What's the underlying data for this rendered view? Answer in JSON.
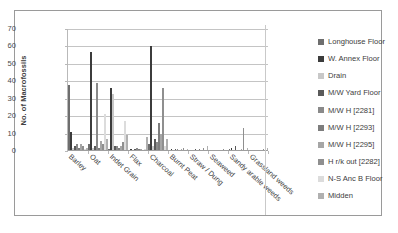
{
  "chart_data": {
    "type": "bar",
    "title": "",
    "xlabel": "",
    "ylabel": "No. of Macrofossils",
    "ylim": [
      0,
      70
    ],
    "yticks": [
      0,
      10,
      20,
      30,
      40,
      50,
      60,
      70
    ],
    "grid": true,
    "legend_position": "right",
    "categories": [
      "Barley",
      "Oat",
      "Indet Grain",
      "Flax",
      "Charcoal",
      "Burnt Peat",
      "Straw / Dung",
      "Seaweed",
      "Sandy arable weeds",
      "Grassland weeds"
    ],
    "series": [
      {
        "name": "Longhouse Floor",
        "color": "#6e6e6e",
        "values": [
          38,
          4,
          1,
          0,
          4,
          0,
          0,
          0,
          1,
          0
        ]
      },
      {
        "name": "W. Annex Floor",
        "color": "#3c3c3c",
        "values": [
          11,
          57,
          36,
          1,
          60,
          1,
          0,
          0,
          2,
          0
        ]
      },
      {
        "name": "Drain",
        "color": "#c8c8c8",
        "values": [
          2,
          2,
          33,
          0,
          3,
          0,
          0,
          0,
          0,
          0
        ]
      },
      {
        "name": "M/W Yard Floor",
        "color": "#5a5a5a",
        "values": [
          3,
          3,
          3,
          1,
          7,
          1,
          1,
          0,
          3,
          0
        ]
      },
      {
        "name": "M/W H [2281]",
        "color": "#8a8a8a",
        "values": [
          4,
          39,
          3,
          2,
          5,
          1,
          0,
          0,
          0,
          0
        ]
      },
      {
        "name": "M/W H [2293]",
        "color": "#7d7d7d",
        "values": [
          2,
          2,
          2,
          1,
          16,
          0,
          1,
          0,
          0,
          0
        ]
      },
      {
        "name": "M/W H [2295]",
        "color": "#a6a6a6",
        "values": [
          4,
          6,
          3,
          1,
          10,
          1,
          0,
          0,
          1,
          0
        ]
      },
      {
        "name": "H r/k out [2282]",
        "color": "#8f8f8f",
        "values": [
          3,
          4,
          5,
          0,
          36,
          2,
          2,
          1,
          13,
          1
        ]
      },
      {
        "name": "N-S Anc B Floor",
        "color": "#dcdcdc",
        "values": [
          1,
          21,
          17,
          1,
          3,
          0,
          0,
          0,
          0,
          0
        ]
      },
      {
        "name": "Midden",
        "color": "#b0b0b0",
        "values": [
          2,
          7,
          9,
          8,
          7,
          1,
          3,
          0,
          2,
          2
        ]
      }
    ]
  },
  "legend": {
    "items": [
      {
        "label": "Longhouse Floor",
        "color": "#6e6e6e"
      },
      {
        "label": "W. Annex Floor",
        "color": "#3c3c3c"
      },
      {
        "label": "Drain",
        "color": "#c8c8c8"
      },
      {
        "label": "M/W Yard Floor",
        "color": "#5a5a5a"
      },
      {
        "label": "M/W H [2281]",
        "color": "#8a8a8a"
      },
      {
        "label": "M/W H [2293]",
        "color": "#7d7d7d"
      },
      {
        "label": "M/W H [2295]",
        "color": "#a6a6a6"
      },
      {
        "label": "H r/k out [2282]",
        "color": "#8f8f8f"
      },
      {
        "label": "N-S Anc B Floor",
        "color": "#dcdcdc"
      },
      {
        "label": "Midden",
        "color": "#b0b0b0"
      }
    ]
  }
}
